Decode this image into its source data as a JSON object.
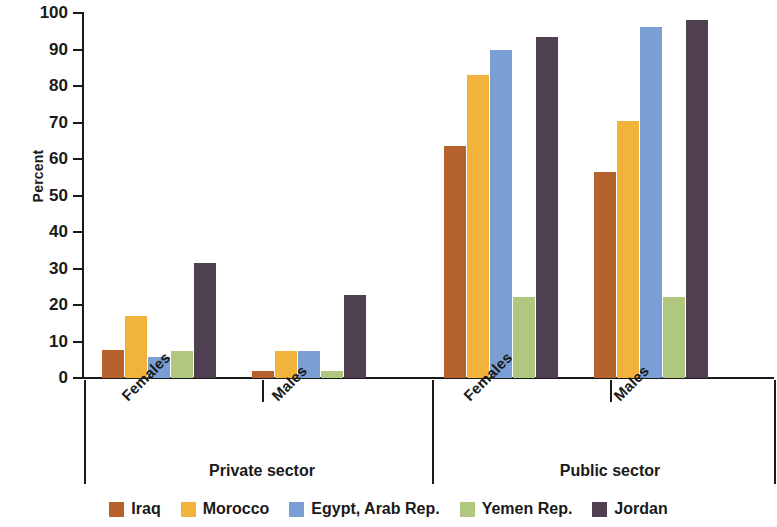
{
  "chart_data": {
    "type": "bar",
    "title": "",
    "xlabel": "",
    "ylabel": "Percent",
    "ylim": [
      0,
      100
    ],
    "ytick_step": 10,
    "yticks": [
      100,
      90,
      80,
      70,
      60,
      50,
      40,
      30,
      20,
      10,
      0
    ],
    "grid": false,
    "legend_position": "bottom",
    "categories": [
      "Females",
      "Males",
      "Females",
      "Males"
    ],
    "group_labels": [
      "Private sector",
      "Public sector"
    ],
    "groups": [
      {
        "sector": "Private sector",
        "subgroups": [
          {
            "name": "Females",
            "values": [
              7.7,
              17.0,
              5.8,
              7.3,
              31.4
            ]
          },
          {
            "name": "Males",
            "values": [
              2.0,
              7.5,
              7.5,
              2.0,
              22.8
            ]
          }
        ]
      },
      {
        "sector": "Public sector",
        "subgroups": [
          {
            "name": "Females",
            "values": [
              63.6,
              83.0,
              89.8,
              22.2,
              93.5
            ]
          },
          {
            "name": "Males",
            "values": [
              56.5,
              70.5,
              96.2,
              22.3,
              98.2
            ]
          }
        ]
      }
    ],
    "series": [
      {
        "name": "Iraq",
        "color": "#b5622e",
        "values": [
          7.7,
          2.0,
          63.6,
          56.5
        ]
      },
      {
        "name": "Morocco",
        "color": "#f2b33d",
        "values": [
          17.0,
          7.5,
          83.0,
          70.5
        ]
      },
      {
        "name": "Egypt, Arab Rep.",
        "color": "#7b9fd4",
        "values": [
          5.8,
          7.5,
          89.8,
          96.2
        ]
      },
      {
        "name": "Yemen Rep.",
        "color": "#afc77e",
        "values": [
          7.3,
          2.0,
          22.2,
          22.3
        ]
      },
      {
        "name": "Jordan",
        "color": "#4f3f50",
        "values": [
          31.4,
          22.8,
          93.5,
          98.2
        ]
      }
    ]
  },
  "legend": {
    "items": [
      {
        "label": "Iraq",
        "color": "#b5622e"
      },
      {
        "label": "Morocco",
        "color": "#f2b33d"
      },
      {
        "label": "Egypt, Arab Rep.",
        "color": "#7b9fd4"
      },
      {
        "label": "Yemen Rep.",
        "color": "#afc77e"
      },
      {
        "label": "Jordan",
        "color": "#4f3f50"
      }
    ]
  }
}
